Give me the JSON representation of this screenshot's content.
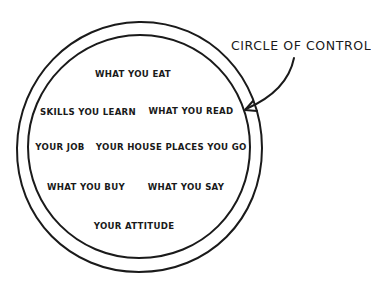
{
  "diagram": {
    "title": "CIRCLE OF CONTROL",
    "colors": {
      "stroke": "#1a1a1a",
      "background": "#ffffff",
      "text": "#1a1a1a"
    },
    "items": [
      {
        "label": "WHAT YOU EAT",
        "x": 133,
        "y": 70
      },
      {
        "label": "SKILLS YOU LEARN",
        "x": 88,
        "y": 108
      },
      {
        "label": "WHAT YOU READ",
        "x": 191,
        "y": 107
      },
      {
        "label": "YOUR JOB",
        "x": 60,
        "y": 143
      },
      {
        "label": "YOUR HOUSE",
        "x": 129,
        "y": 143
      },
      {
        "label": "PLACES YOU GO",
        "x": 206,
        "y": 143
      },
      {
        "label": "WHAT YOU BUY",
        "x": 86,
        "y": 183
      },
      {
        "label": "WHAT YOU SAY",
        "x": 186,
        "y": 183
      },
      {
        "label": "YOUR ATTITUDE",
        "x": 134,
        "y": 222
      }
    ]
  }
}
